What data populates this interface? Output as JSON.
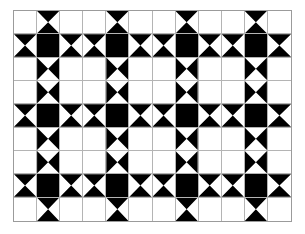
{
  "figure": {
    "kind": "geometric-tiling",
    "background_color": "#ffffff",
    "ink_color": "#000000",
    "grid_line_color": "#b4b4b4",
    "border_color": "#9b9b9b"
  },
  "grid": {
    "columns": 12,
    "rows": 9,
    "cell_width_px": 23.2,
    "cell_height_px": 23.5,
    "origin_x_px": 13,
    "origin_y_px": 10,
    "width_px": 279,
    "height_px": 212,
    "legend": {
      "white": "empty white square",
      "black": "solid black square",
      "bowtie-h": "horizontal bowtie, black triangles top and bottom",
      "bowtie-v": "vertical bowtie, black triangles left and right"
    },
    "cells": [
      [
        "white",
        "bowtie-h",
        "white",
        "white",
        "bowtie-h",
        "white",
        "white",
        "bowtie-h",
        "white",
        "white",
        "bowtie-h",
        "white"
      ],
      [
        "bowtie-h",
        "black",
        "bowtie-h",
        "bowtie-h",
        "black",
        "bowtie-h",
        "bowtie-h",
        "black",
        "bowtie-h",
        "bowtie-h",
        "black",
        "bowtie-h"
      ],
      [
        "white",
        "bowtie-v",
        "white",
        "white",
        "bowtie-v",
        "white",
        "white",
        "bowtie-v",
        "white",
        "white",
        "bowtie-v",
        "white"
      ],
      [
        "white",
        "bowtie-v",
        "white",
        "white",
        "bowtie-v",
        "white",
        "white",
        "bowtie-v",
        "white",
        "white",
        "bowtie-v",
        "white"
      ],
      [
        "bowtie-h",
        "black",
        "bowtie-h",
        "bowtie-h",
        "black",
        "bowtie-h",
        "bowtie-h",
        "black",
        "bowtie-h",
        "bowtie-h",
        "black",
        "bowtie-h"
      ],
      [
        "white",
        "bowtie-v",
        "white",
        "white",
        "bowtie-v",
        "white",
        "white",
        "bowtie-v",
        "white",
        "white",
        "bowtie-v",
        "white"
      ],
      [
        "white",
        "bowtie-v",
        "white",
        "white",
        "bowtie-v",
        "white",
        "white",
        "bowtie-v",
        "white",
        "white",
        "bowtie-v",
        "white"
      ],
      [
        "bowtie-h",
        "black",
        "bowtie-h",
        "bowtie-h",
        "black",
        "bowtie-h",
        "bowtie-h",
        "black",
        "bowtie-h",
        "bowtie-h",
        "black",
        "bowtie-h"
      ],
      [
        "white",
        "bowtie-h",
        "white",
        "white",
        "bowtie-h",
        "white",
        "white",
        "bowtie-h",
        "white",
        "white",
        "bowtie-h",
        "white"
      ]
    ]
  }
}
